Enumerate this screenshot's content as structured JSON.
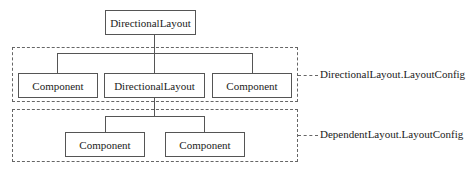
{
  "diagram": {
    "root": {
      "label": "DirectionalLayout"
    },
    "group1": {
      "config_label": "DirectionalLayout.LayoutConfig",
      "nodes": [
        {
          "label": "Component"
        },
        {
          "label": "DirectionalLayout"
        },
        {
          "label": "Component"
        }
      ]
    },
    "group2": {
      "config_label": "DependentLayout.LayoutConfig",
      "nodes": [
        {
          "label": "Component"
        },
        {
          "label": "Component"
        }
      ]
    },
    "colors": {
      "stroke": "#555555",
      "dashed": "#666666",
      "background": "#ffffff"
    }
  }
}
